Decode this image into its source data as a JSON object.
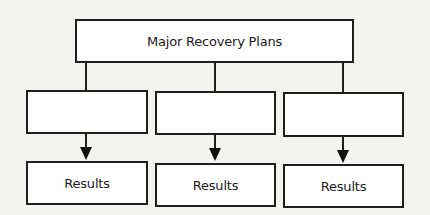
{
  "diagram": {
    "root": {
      "label": "Major Recovery Plans"
    },
    "branches": [
      {
        "plan_label": "",
        "result_label": "Results"
      },
      {
        "plan_label": "",
        "result_label": "Results"
      },
      {
        "plan_label": "",
        "result_label": "Results"
      }
    ],
    "colors": {
      "line": "#1e1e1e",
      "box_fill": "#ffffff",
      "background": "#f3f3f1"
    }
  }
}
